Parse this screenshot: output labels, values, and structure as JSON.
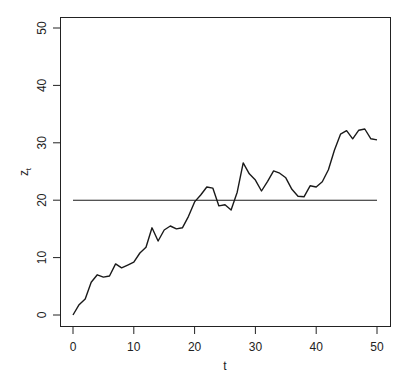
{
  "chart_data": {
    "type": "line",
    "title": "",
    "xlabel": "t",
    "ylabel": "z",
    "ylabel_subscript": "t",
    "xlim": [
      0,
      50
    ],
    "ylim": [
      0,
      50
    ],
    "xticks": [
      0,
      10,
      20,
      30,
      40,
      50
    ],
    "yticks": [
      0,
      10,
      20,
      30,
      40,
      50
    ],
    "grid": false,
    "legend": null,
    "series": [
      {
        "name": "z_t",
        "x": [
          0,
          1,
          2,
          3,
          4,
          5,
          6,
          7,
          8,
          9,
          10,
          11,
          12,
          13,
          14,
          15,
          16,
          17,
          18,
          19,
          20,
          21,
          22,
          23,
          24,
          25,
          26,
          27,
          28,
          29,
          30,
          31,
          32,
          33,
          34,
          35,
          36,
          37,
          38,
          39,
          40,
          41,
          42,
          43,
          44,
          45,
          46,
          47,
          48,
          49,
          50
        ],
        "values": [
          0,
          1.8,
          2.8,
          5.7,
          7.0,
          6.6,
          6.8,
          8.9,
          8.2,
          8.7,
          9.2,
          10.8,
          11.8,
          15.2,
          12.9,
          14.8,
          15.5,
          15.0,
          15.2,
          17.2,
          19.7,
          20.9,
          22.3,
          22.1,
          19.0,
          19.2,
          18.3,
          21.4,
          26.5,
          24.6,
          23.5,
          21.6,
          23.3,
          25.1,
          24.7,
          23.9,
          21.9,
          20.7,
          20.6,
          22.5,
          22.3,
          23.2,
          25.3,
          28.7,
          31.5,
          32.1,
          30.7,
          32.2,
          32.4,
          30.7,
          30.5
        ]
      },
      {
        "name": "reference level",
        "x": [
          0,
          50
        ],
        "values": [
          20,
          20
        ]
      }
    ]
  },
  "colors": {
    "line": "#1a1a1a",
    "axis": "#222222",
    "background": "#ffffff"
  }
}
